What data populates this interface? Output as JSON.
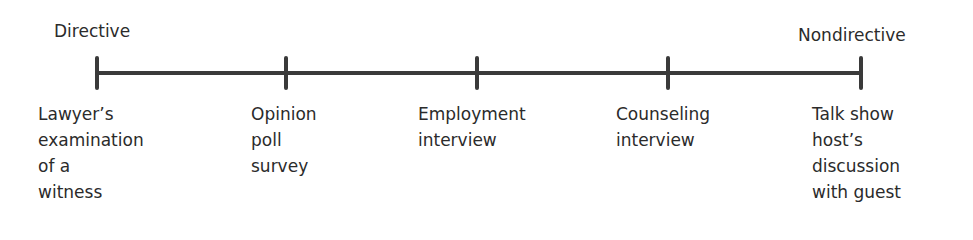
{
  "ends": {
    "left": "Directive",
    "right": "Nondirective"
  },
  "colors": {
    "line": "#3a3a3a",
    "text": "#2b2b2b"
  },
  "points": [
    {
      "x": 97,
      "label_x": 38,
      "label": "Lawyer’s\nexamination\nof a\nwitness"
    },
    {
      "x": 286,
      "label_x": 251,
      "label": "Opinion\npoll\nsurvey"
    },
    {
      "x": 477,
      "label_x": 418,
      "label": "Employment\ninterview"
    },
    {
      "x": 668,
      "label_x": 616,
      "label": "Counseling\ninterview"
    },
    {
      "x": 861,
      "label_x": 812,
      "label": "Talk show\nhost’s\ndiscussion\nwith guest"
    }
  ]
}
